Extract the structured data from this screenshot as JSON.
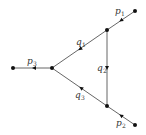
{
  "diagram": {
    "type": "feynman-triangle-graph",
    "nodes": [
      {
        "id": "ext-left",
        "x": 13,
        "y": 68
      },
      {
        "id": "vertex-left",
        "x": 52,
        "y": 68
      },
      {
        "id": "vertex-top",
        "x": 107,
        "y": 30
      },
      {
        "id": "ext-top",
        "x": 135,
        "y": 11
      },
      {
        "id": "vertex-bottom",
        "x": 107,
        "y": 106
      },
      {
        "id": "ext-bottom",
        "x": 135,
        "y": 125
      }
    ],
    "edges": [
      {
        "id": "p1",
        "from": "vertex-top",
        "to": "ext-top",
        "label": "p",
        "sub": "1"
      },
      {
        "id": "p2",
        "from": "vertex-bottom",
        "to": "ext-bottom",
        "label": "p",
        "sub": "2"
      },
      {
        "id": "p3",
        "from": "ext-left",
        "to": "vertex-left",
        "label": "p",
        "sub": "3"
      },
      {
        "id": "q1",
        "from": "vertex-left",
        "to": "vertex-top",
        "label": "q",
        "sub": "1"
      },
      {
        "id": "q2",
        "from": "vertex-top",
        "to": "vertex-bottom",
        "label": "q",
        "sub": "2"
      },
      {
        "id": "q3",
        "from": "vertex-bottom",
        "to": "vertex-left",
        "label": "q",
        "sub": "3"
      }
    ],
    "labels": {
      "p1": {
        "main": "p",
        "sub": "1"
      },
      "p2": {
        "main": "p",
        "sub": "2"
      },
      "p3": {
        "main": "p",
        "sub": "3"
      },
      "q1": {
        "main": "q",
        "sub": "1"
      },
      "q2": {
        "main": "q",
        "sub": "2"
      },
      "q3": {
        "main": "q",
        "sub": "3"
      }
    }
  }
}
